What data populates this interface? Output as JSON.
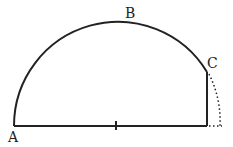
{
  "diagram": {
    "labels": {
      "a": "A",
      "b": "B",
      "c": "C"
    },
    "stroke_color": "#222222",
    "background": "#ffffff"
  }
}
